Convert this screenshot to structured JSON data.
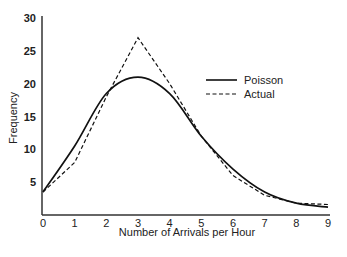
{
  "chart_data": {
    "type": "line",
    "title": "",
    "xlabel": "Number of Arrivals per Hour",
    "ylabel": "Frequency",
    "x": [
      0,
      1,
      2,
      3,
      4,
      5,
      6,
      7,
      8,
      9
    ],
    "xticks": [
      "0",
      "1",
      "2",
      "3",
      "4",
      "5",
      "6",
      "7",
      "8",
      "9"
    ],
    "yticks": [
      "5",
      "10",
      "15",
      "20",
      "25",
      "30"
    ],
    "ylim": [
      0,
      30
    ],
    "xlim": [
      0,
      9
    ],
    "grid": false,
    "legend_position": "upper right",
    "series": [
      {
        "name": "Poisson",
        "style": "solid",
        "values": [
          3.5,
          10.5,
          18.5,
          21,
          18.5,
          12,
          7,
          3.5,
          1.8,
          1.2
        ]
      },
      {
        "name": "Actual",
        "style": "dashed",
        "values": [
          3.5,
          8,
          18,
          27,
          20,
          12,
          6,
          3,
          1.8,
          1.6
        ]
      }
    ]
  }
}
